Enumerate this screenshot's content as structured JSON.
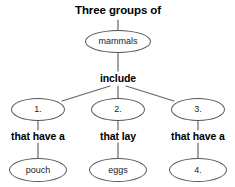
{
  "diagram": {
    "type": "concept-map",
    "title": "Three groups of",
    "nodes": [
      {
        "id": "title",
        "label": "Three groups of",
        "shape": "text",
        "x": 118,
        "y": 11,
        "w": 118,
        "h": 16
      },
      {
        "id": "root",
        "label": "mammals",
        "shape": "ellipse",
        "x": 118,
        "y": 41,
        "w": 66,
        "h": 23
      },
      {
        "id": "link1",
        "label": "include",
        "shape": "text",
        "x": 118,
        "y": 78,
        "w": 60,
        "h": 15
      },
      {
        "id": "g1",
        "label": "1.",
        "shape": "ellipse",
        "x": 38,
        "y": 109,
        "w": 54,
        "h": 23
      },
      {
        "id": "g2",
        "label": "2.",
        "shape": "ellipse",
        "x": 118,
        "y": 109,
        "w": 54,
        "h": 23
      },
      {
        "id": "g3",
        "label": "3.",
        "shape": "ellipse",
        "x": 198,
        "y": 109,
        "w": 54,
        "h": 23
      },
      {
        "id": "link2",
        "label": "that have a",
        "shape": "text",
        "x": 38,
        "y": 136,
        "w": 76,
        "h": 15
      },
      {
        "id": "link3",
        "label": "that lay",
        "shape": "text",
        "x": 118,
        "y": 136,
        "w": 60,
        "h": 15
      },
      {
        "id": "link4",
        "label": "that have a",
        "shape": "text",
        "x": 198,
        "y": 136,
        "w": 76,
        "h": 15
      },
      {
        "id": "leaf1",
        "label": "pouch",
        "shape": "ellipse",
        "x": 38,
        "y": 170,
        "w": 58,
        "h": 24
      },
      {
        "id": "leaf2",
        "label": "eggs",
        "shape": "ellipse",
        "x": 118,
        "y": 170,
        "w": 58,
        "h": 24
      },
      {
        "id": "leaf3",
        "label": "4.",
        "shape": "ellipse",
        "x": 198,
        "y": 170,
        "w": 58,
        "h": 24
      }
    ],
    "edges": [
      {
        "from": "title",
        "to": "root",
        "x1": 118,
        "y1": 20,
        "x2": 118,
        "y2": 30
      },
      {
        "from": "root",
        "to": "link1",
        "x1": 118,
        "y1": 53,
        "x2": 118,
        "y2": 71
      },
      {
        "from": "link1",
        "to": "g1",
        "x1": 110,
        "y1": 86,
        "x2": 62,
        "y2": 101
      },
      {
        "from": "link1",
        "to": "g2",
        "x1": 118,
        "y1": 86,
        "x2": 118,
        "y2": 98
      },
      {
        "from": "link1",
        "to": "g3",
        "x1": 126,
        "y1": 86,
        "x2": 174,
        "y2": 101
      },
      {
        "from": "g1",
        "to": "link2",
        "x1": 38,
        "y1": 121,
        "x2": 38,
        "y2": 130
      },
      {
        "from": "g2",
        "to": "link3",
        "x1": 118,
        "y1": 121,
        "x2": 118,
        "y2": 130
      },
      {
        "from": "g3",
        "to": "link4",
        "x1": 198,
        "y1": 121,
        "x2": 198,
        "y2": 130
      },
      {
        "from": "link2",
        "to": "leaf1",
        "x1": 38,
        "y1": 143,
        "x2": 38,
        "y2": 158
      },
      {
        "from": "link3",
        "to": "leaf2",
        "x1": 118,
        "y1": 143,
        "x2": 118,
        "y2": 158
      },
      {
        "from": "link4",
        "to": "leaf3",
        "x1": 198,
        "y1": 143,
        "x2": 198,
        "y2": 158
      }
    ],
    "colors": {
      "background": "#ffffff",
      "ellipse_stroke": "#555555",
      "edge_stroke": "#666666",
      "bold_text": "#000000",
      "node_text": "#1a1a1a"
    }
  }
}
